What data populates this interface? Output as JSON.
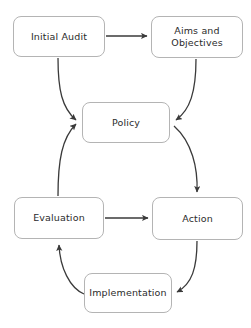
{
  "diagram": {
    "background_color": "#ffffff",
    "node_fill": "#ffffff",
    "node_border_color": "#b4b4b4",
    "edge_color": "#3a3a3a",
    "text_color": "#2b2b2b",
    "nodes": [
      {
        "id": "initial-audit",
        "label": "Initial Audit",
        "x": 13,
        "y": 16,
        "w": 92,
        "h": 41
      },
      {
        "id": "aims-and-objectives",
        "label": "Aims and\nObjectives",
        "x": 151,
        "y": 16,
        "w": 92,
        "h": 42
      },
      {
        "id": "policy",
        "label": "Policy",
        "x": 82,
        "y": 102,
        "w": 88,
        "h": 41
      },
      {
        "id": "evaluation",
        "label": "Evaluation",
        "x": 14,
        "y": 197,
        "w": 90,
        "h": 42
      },
      {
        "id": "action",
        "label": "Action",
        "x": 152,
        "y": 197,
        "w": 91,
        "h": 43
      },
      {
        "id": "implementation",
        "label": "Implementation",
        "x": 84,
        "y": 273,
        "w": 88,
        "h": 40
      }
    ],
    "edges": [
      {
        "id": "initial-audit-to-aims",
        "from": "initial-audit",
        "to": "aims-and-objectives",
        "shape": "straight",
        "path": "M 106 36 L 147 36"
      },
      {
        "id": "initial-audit-to-policy",
        "from": "initial-audit",
        "to": "policy",
        "shape": "curved",
        "path": "M 58 58 C 58 90 62 108 76 120"
      },
      {
        "id": "aims-to-policy",
        "from": "aims-and-objectives",
        "to": "policy",
        "shape": "curved",
        "path": "M 196 59 C 196 92 190 110 176 120"
      },
      {
        "id": "policy-to-action",
        "from": "policy",
        "to": "action",
        "shape": "curved",
        "path": "M 174 126 C 192 142 198 168 197 192"
      },
      {
        "id": "evaluation-to-policy",
        "from": "evaluation",
        "to": "policy",
        "shape": "curved",
        "path": "M 58 196 C 58 160 62 138 76 124"
      },
      {
        "id": "evaluation-to-action",
        "from": "evaluation",
        "to": "action",
        "shape": "straight",
        "path": "M 105 218 L 148 218"
      },
      {
        "id": "action-to-implementation",
        "from": "action",
        "to": "implementation",
        "shape": "curved",
        "path": "M 197 241 C 197 268 192 284 177 292"
      },
      {
        "id": "implementation-to-evaluation",
        "from": "implementation",
        "to": "evaluation",
        "shape": "curved",
        "path": "M 84 294 C 70 288 60 268 59 245"
      }
    ]
  }
}
